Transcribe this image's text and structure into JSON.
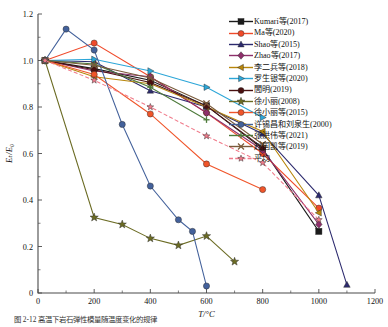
{
  "figure": {
    "caption": "图 2-12    高温下岩石弹性模量随温度变化的规律  ",
    "background": "#ffffff"
  },
  "chart_data": {
    "type": "line",
    "title": "",
    "xlabel": "T/°C",
    "ylabel": "Eₜ/E₀",
    "xlim": [
      0,
      1200
    ],
    "ylim": [
      0,
      1.2
    ],
    "xticks": [
      0,
      200,
      400,
      600,
      800,
      1000,
      1200
    ],
    "yticks": [
      0,
      0.2,
      0.4,
      0.6,
      0.8,
      1.0,
      1.2
    ],
    "xtick_labels": [
      "0",
      "200",
      "400",
      "600",
      "800",
      "1000",
      "1200"
    ],
    "ytick_labels": [
      "0",
      "0.2",
      "0.4",
      "0.6",
      "0.8",
      "1.0",
      "1.2"
    ],
    "minor_ticks": true,
    "grid": false,
    "legend_position": "upper-right",
    "series": [
      {
        "name": "Kumari等(2017)",
        "color": "#1b1b1b",
        "marker": "square",
        "x": [
          25,
          200,
          400,
          600,
          800,
          1000
        ],
        "y": [
          1.0,
          0.965,
          0.915,
          0.805,
          0.62,
          0.265
        ]
      },
      {
        "name": "Ma等(2020)",
        "color": "#f04a2a",
        "marker": "circle",
        "x": [
          25,
          200,
          400,
          600,
          800,
          1000
        ],
        "y": [
          1.0,
          1.075,
          0.93,
          0.775,
          0.6,
          0.365
        ]
      },
      {
        "name": "Shao等(2015)",
        "color": "#2c2a6e",
        "marker": "triangle-up",
        "x": [
          25,
          200,
          400,
          600,
          800,
          1000,
          1100
        ],
        "y": [
          1.0,
          0.995,
          0.87,
          0.8,
          0.685,
          0.42,
          0.035
        ]
      },
      {
        "name": "Zhao等(2017)",
        "color": "#8e2f6b",
        "marker": "diamond",
        "x": [
          25,
          200,
          400,
          600,
          800,
          1000
        ],
        "y": [
          1.0,
          0.955,
          0.93,
          0.775,
          0.615,
          0.295
        ]
      },
      {
        "name": "李二兵等(2018)",
        "color": "#b8860b",
        "marker": "triangle-left",
        "x": [
          25,
          200,
          400,
          600,
          800,
          1000
        ],
        "y": [
          1.0,
          0.93,
          0.9,
          0.8,
          0.695,
          0.345
        ]
      },
      {
        "name": "罗生银等(2020)",
        "color": "#2ca6d8",
        "marker": "triangle-right",
        "x": [
          25,
          200,
          400,
          600,
          800
        ],
        "y": [
          1.0,
          1.005,
          0.955,
          0.885,
          0.755
        ]
      },
      {
        "name": "閭明(2019)",
        "color": "#4a1010",
        "marker": "circle",
        "x": [
          25,
          200,
          400,
          600,
          800
        ],
        "y": [
          1.0,
          0.96,
          0.905,
          0.805,
          0.625
        ]
      },
      {
        "name": "徐小丽(2008)",
        "color": "#6b6b23",
        "marker": "star",
        "x": [
          25,
          200,
          300,
          400,
          500,
          600,
          700
        ],
        "y": [
          1.0,
          0.325,
          0.295,
          0.235,
          0.205,
          0.245,
          0.135
        ]
      },
      {
        "name": "徐小丽等(2015)",
        "color": "#f0552a",
        "marker": "circle",
        "x": [
          25,
          200,
          400,
          600,
          800
        ],
        "y": [
          1.0,
          0.94,
          0.77,
          0.555,
          0.445
        ]
      },
      {
        "name": "许锡昌和刘泉生(2000)",
        "color": "#43619b",
        "marker": "circle",
        "x": [
          25,
          100,
          200,
          300,
          400,
          500,
          550,
          600
        ],
        "y": [
          1.0,
          1.135,
          1.045,
          0.725,
          0.46,
          0.315,
          0.265,
          0.03
        ]
      },
      {
        "name": "张洪伟等(2021)",
        "color": "#4d7a3a",
        "marker": "plus",
        "x": [
          25,
          200,
          400,
          600
        ],
        "y": [
          1.0,
          0.985,
          0.885,
          0.745
        ]
      },
      {
        "name": "赵国凯等(2019)",
        "color": "#7a5a3a",
        "marker": "cross",
        "x": [
          25,
          200,
          400,
          600,
          800
        ],
        "y": [
          1.0,
          0.98,
          0.925,
          0.815,
          0.64
        ]
      },
      {
        "name": "平均",
        "color": "#f07a8a",
        "marker": "star-small",
        "x": [
          25,
          200,
          400,
          600,
          800,
          1000
        ],
        "y": [
          1.0,
          0.915,
          0.8,
          0.675,
          0.56,
          0.315
        ]
      }
    ]
  }
}
